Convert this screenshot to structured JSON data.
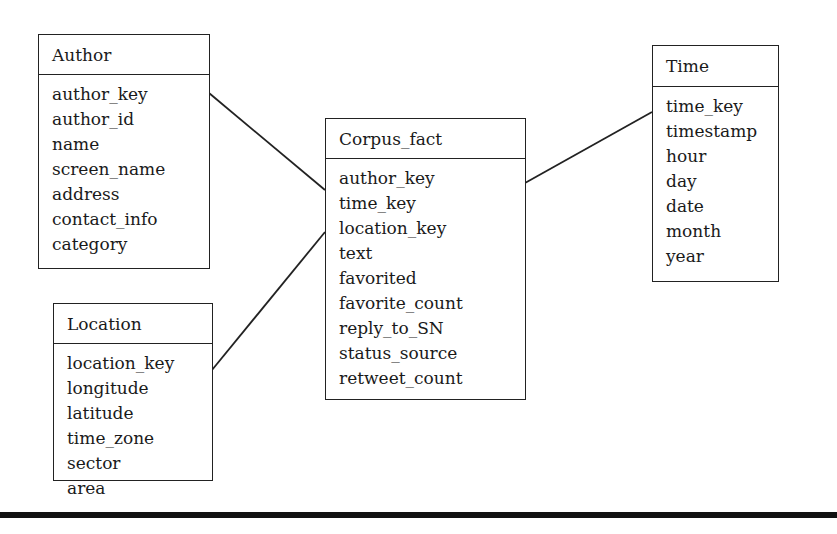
{
  "diagram": {
    "type": "star-schema",
    "entities": {
      "author": {
        "title": "Author",
        "fields": [
          "author_key",
          "author_id",
          "name",
          "screen_name",
          "address",
          "contact_info",
          "category"
        ]
      },
      "location": {
        "title": "Location",
        "fields": [
          "location_key",
          "longitude",
          "latitude",
          "time_zone",
          "sector",
          "area"
        ]
      },
      "corpus_fact": {
        "title": "Corpus_fact",
        "fields": [
          "author_key",
          "time_key",
          "location_key",
          "text",
          "favorited",
          "favorite_count",
          "reply_to_SN",
          "status_source",
          "retweet_count"
        ]
      },
      "time": {
        "title": "Time",
        "fields": [
          "time_key",
          "timestamp",
          "hour",
          "day",
          "date",
          "month",
          "year"
        ]
      }
    },
    "relationships": [
      {
        "from": "Author",
        "to": "Corpus_fact"
      },
      {
        "from": "Location",
        "to": "Corpus_fact"
      },
      {
        "from": "Corpus_fact",
        "to": "Time"
      }
    ],
    "colors": {
      "line": "#222222",
      "background": "#ffffff",
      "text": "#1a1a1a"
    }
  }
}
